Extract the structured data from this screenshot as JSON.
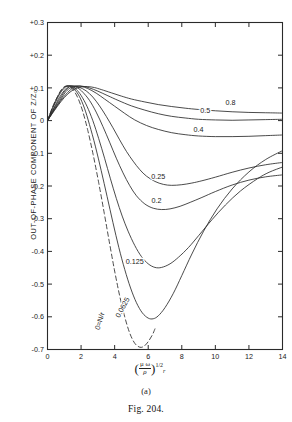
{
  "figure": {
    "caption": "Fig. 204.",
    "caption_prefix": "F",
    "caption_rest": "IG. 204.",
    "panel_label": "(a)"
  },
  "chart_data": {
    "type": "line",
    "title": "",
    "subtitle": "",
    "xlabel": "(μω/ρ)^1/2 r",
    "xlabel_parts": {
      "numerator": "μ ω",
      "denominator": "ρ",
      "exponent": "1/2",
      "trailing_var": "r"
    },
    "ylabel": "OUT-OF-PHASE COMPONENT OF Z/Z₀",
    "xlim": [
      0,
      14
    ],
    "ylim": [
      -0.7,
      0.3
    ],
    "grid": false,
    "legend_position": "inline-curve-labels",
    "xticks": [
      0,
      2,
      4,
      6,
      8,
      10,
      12,
      14
    ],
    "xticklabels": [
      "0",
      "2",
      "4",
      "6",
      "8",
      "10",
      "12",
      "14"
    ],
    "yticks": [
      0.3,
      0.2,
      0.1,
      0.0,
      -0.1,
      -0.2,
      -0.3,
      -0.4,
      -0.5,
      -0.6,
      -0.7
    ],
    "yticklabels": [
      "+0.3",
      "+0.2",
      "+0.1",
      "0",
      "-0.1",
      "-0.2",
      "-0.3",
      "-0.4",
      "-0.5",
      "-0.6",
      "-0.7"
    ],
    "annotations": [
      {
        "text": "0.8",
        "x": 10.9,
        "y": 0.047,
        "rotation": 0
      },
      {
        "text": "0.5",
        "x": 9.4,
        "y": 0.022,
        "rotation": 0
      },
      {
        "text": "0.4",
        "x": 9.0,
        "y": -0.034,
        "rotation": 0
      },
      {
        "text": "0.25",
        "x": 6.6,
        "y": -0.178,
        "rotation": 0
      },
      {
        "text": "0.2",
        "x": 6.5,
        "y": -0.252,
        "rotation": 0
      },
      {
        "text": "0.125",
        "x": 5.2,
        "y": -0.44,
        "rotation": 0
      },
      {
        "text": "0.0625",
        "x": 4.6,
        "y": -0.575,
        "rotation": -62
      },
      {
        "text": "0=N/r",
        "x": 3.25,
        "y": -0.615,
        "rotation": -73
      }
    ],
    "series": [
      {
        "name": "0.8",
        "label": "0.8",
        "style": "solid",
        "points": [
          [
            0,
            0
          ],
          [
            0.4,
            0.03
          ],
          [
            0.8,
            0.058
          ],
          [
            1.2,
            0.081
          ],
          [
            1.6,
            0.096
          ],
          [
            2.0,
            0.103
          ],
          [
            2.4,
            0.104
          ],
          [
            2.8,
            0.101
          ],
          [
            3.2,
            0.095
          ],
          [
            3.8,
            0.085
          ],
          [
            4.4,
            0.075
          ],
          [
            5.0,
            0.066
          ],
          [
            5.8,
            0.057
          ],
          [
            6.6,
            0.049
          ],
          [
            7.4,
            0.043
          ],
          [
            8.2,
            0.038
          ],
          [
            9.0,
            0.034
          ],
          [
            10.0,
            0.03
          ],
          [
            11.0,
            0.027
          ],
          [
            12.0,
            0.025
          ],
          [
            13.0,
            0.024
          ],
          [
            14.0,
            0.023
          ]
        ]
      },
      {
        "name": "0.5",
        "label": "0.5",
        "style": "solid",
        "points": [
          [
            0,
            0
          ],
          [
            0.4,
            0.032
          ],
          [
            0.8,
            0.062
          ],
          [
            1.2,
            0.086
          ],
          [
            1.5,
            0.099
          ],
          [
            1.8,
            0.105
          ],
          [
            2.1,
            0.105
          ],
          [
            2.5,
            0.1
          ],
          [
            3.0,
            0.09
          ],
          [
            3.6,
            0.076
          ],
          [
            4.2,
            0.062
          ],
          [
            5.0,
            0.045
          ],
          [
            5.8,
            0.032
          ],
          [
            6.6,
            0.021
          ],
          [
            7.4,
            0.013
          ],
          [
            8.2,
            0.008
          ],
          [
            9.0,
            0.004
          ],
          [
            10.0,
            0.002
          ],
          [
            11.0,
            0.001
          ],
          [
            12.0,
            0.002
          ],
          [
            13.0,
            0.003
          ],
          [
            14.0,
            0.004
          ]
        ]
      },
      {
        "name": "0.4",
        "label": "0.4",
        "style": "solid",
        "points": [
          [
            0,
            0
          ],
          [
            0.4,
            0.034
          ],
          [
            0.8,
            0.066
          ],
          [
            1.1,
            0.089
          ],
          [
            1.4,
            0.101
          ],
          [
            1.7,
            0.106
          ],
          [
            2.0,
            0.105
          ],
          [
            2.4,
            0.098
          ],
          [
            2.9,
            0.084
          ],
          [
            3.4,
            0.066
          ],
          [
            4.0,
            0.044
          ],
          [
            4.6,
            0.022
          ],
          [
            5.2,
            0.002
          ],
          [
            5.9,
            -0.015
          ],
          [
            6.6,
            -0.027
          ],
          [
            7.4,
            -0.037
          ],
          [
            8.2,
            -0.043
          ],
          [
            9.0,
            -0.047
          ],
          [
            10.0,
            -0.049
          ],
          [
            11.0,
            -0.049
          ],
          [
            12.0,
            -0.048
          ],
          [
            13.0,
            -0.046
          ],
          [
            14.0,
            -0.044
          ]
        ]
      },
      {
        "name": "0.25",
        "label": "0.25",
        "style": "solid",
        "points": [
          [
            0,
            0
          ],
          [
            0.4,
            0.038
          ],
          [
            0.8,
            0.072
          ],
          [
            1.0,
            0.088
          ],
          [
            1.3,
            0.103
          ],
          [
            1.6,
            0.106
          ],
          [
            1.9,
            0.102
          ],
          [
            2.3,
            0.091
          ],
          [
            2.7,
            0.072
          ],
          [
            3.1,
            0.045
          ],
          [
            3.5,
            0.013
          ],
          [
            3.9,
            -0.022
          ],
          [
            4.3,
            -0.059
          ],
          [
            4.7,
            -0.094
          ],
          [
            5.1,
            -0.124
          ],
          [
            5.5,
            -0.15
          ],
          [
            5.9,
            -0.17
          ],
          [
            6.4,
            -0.186
          ],
          [
            6.9,
            -0.195
          ],
          [
            7.4,
            -0.198
          ],
          [
            8.0,
            -0.196
          ],
          [
            8.6,
            -0.191
          ],
          [
            9.2,
            -0.184
          ],
          [
            10.0,
            -0.173
          ],
          [
            11.0,
            -0.158
          ],
          [
            12.0,
            -0.145
          ],
          [
            13.0,
            -0.135
          ],
          [
            14.0,
            -0.128
          ]
        ]
      },
      {
        "name": "0.2",
        "label": "0.2",
        "style": "solid",
        "points": [
          [
            0,
            0
          ],
          [
            0.4,
            0.04
          ],
          [
            0.7,
            0.07
          ],
          [
            1.0,
            0.092
          ],
          [
            1.25,
            0.104
          ],
          [
            1.5,
            0.106
          ],
          [
            1.8,
            0.1
          ],
          [
            2.1,
            0.087
          ],
          [
            2.5,
            0.062
          ],
          [
            2.9,
            0.026
          ],
          [
            3.3,
            -0.018
          ],
          [
            3.7,
            -0.066
          ],
          [
            4.1,
            -0.115
          ],
          [
            4.5,
            -0.16
          ],
          [
            4.9,
            -0.199
          ],
          [
            5.3,
            -0.23
          ],
          [
            5.8,
            -0.255
          ],
          [
            6.3,
            -0.268
          ],
          [
            6.8,
            -0.272
          ],
          [
            7.3,
            -0.27
          ],
          [
            7.9,
            -0.262
          ],
          [
            8.5,
            -0.25
          ],
          [
            9.2,
            -0.235
          ],
          [
            10.0,
            -0.217
          ],
          [
            11.0,
            -0.197
          ],
          [
            12.0,
            -0.182
          ],
          [
            13.0,
            -0.172
          ],
          [
            14.0,
            -0.166
          ]
        ]
      },
      {
        "name": "0.125",
        "label": "0.125",
        "style": "solid",
        "points": [
          [
            0,
            0
          ],
          [
            0.35,
            0.042
          ],
          [
            0.65,
            0.074
          ],
          [
            0.9,
            0.094
          ],
          [
            1.15,
            0.105
          ],
          [
            1.4,
            0.106
          ],
          [
            1.7,
            0.096
          ],
          [
            2.0,
            0.077
          ],
          [
            2.35,
            0.044
          ],
          [
            2.7,
            0.0
          ],
          [
            3.05,
            -0.055
          ],
          [
            3.4,
            -0.115
          ],
          [
            3.75,
            -0.178
          ],
          [
            4.1,
            -0.238
          ],
          [
            4.45,
            -0.292
          ],
          [
            4.8,
            -0.338
          ],
          [
            5.2,
            -0.382
          ],
          [
            5.6,
            -0.416
          ],
          [
            6.0,
            -0.438
          ],
          [
            6.4,
            -0.449
          ],
          [
            6.8,
            -0.449
          ],
          [
            7.3,
            -0.438
          ],
          [
            7.8,
            -0.418
          ],
          [
            8.4,
            -0.388
          ],
          [
            9.0,
            -0.352
          ],
          [
            9.8,
            -0.303
          ],
          [
            10.6,
            -0.258
          ],
          [
            11.5,
            -0.215
          ],
          [
            12.5,
            -0.178
          ],
          [
            13.2,
            -0.158
          ],
          [
            14.0,
            -0.142
          ]
        ]
      },
      {
        "name": "0.0625",
        "label": "0.0625",
        "style": "solid",
        "points": [
          [
            0,
            0
          ],
          [
            0.3,
            0.04
          ],
          [
            0.6,
            0.073
          ],
          [
            0.85,
            0.094
          ],
          [
            1.1,
            0.105
          ],
          [
            1.35,
            0.105
          ],
          [
            1.6,
            0.096
          ],
          [
            1.9,
            0.074
          ],
          [
            2.2,
            0.038
          ],
          [
            2.5,
            -0.012
          ],
          [
            2.85,
            -0.078
          ],
          [
            3.2,
            -0.153
          ],
          [
            3.55,
            -0.232
          ],
          [
            3.9,
            -0.312
          ],
          [
            4.25,
            -0.388
          ],
          [
            4.6,
            -0.455
          ],
          [
            4.95,
            -0.512
          ],
          [
            5.3,
            -0.557
          ],
          [
            5.65,
            -0.588
          ],
          [
            6.0,
            -0.604
          ],
          [
            6.3,
            -0.606
          ],
          [
            6.6,
            -0.597
          ],
          [
            7.0,
            -0.572
          ],
          [
            7.5,
            -0.528
          ],
          [
            8.0,
            -0.474
          ],
          [
            8.6,
            -0.408
          ],
          [
            9.3,
            -0.338
          ],
          [
            10.1,
            -0.27
          ],
          [
            11.0,
            -0.209
          ],
          [
            12.0,
            -0.157
          ],
          [
            13.0,
            -0.119
          ],
          [
            14.0,
            -0.092
          ]
        ]
      },
      {
        "name": "0=N/r",
        "label": "0=N/r",
        "style": "dashed",
        "points": [
          [
            0,
            0
          ],
          [
            0.3,
            0.041
          ],
          [
            0.6,
            0.074
          ],
          [
            0.82,
            0.094
          ],
          [
            1.05,
            0.105
          ],
          [
            1.3,
            0.104
          ],
          [
            1.55,
            0.093
          ],
          [
            1.82,
            0.068
          ],
          [
            2.1,
            0.028
          ],
          [
            2.4,
            -0.03
          ],
          [
            2.72,
            -0.104
          ],
          [
            3.05,
            -0.19
          ],
          [
            3.38,
            -0.283
          ],
          [
            3.7,
            -0.376
          ],
          [
            4.0,
            -0.46
          ],
          [
            4.3,
            -0.536
          ],
          [
            4.6,
            -0.6
          ],
          [
            4.9,
            -0.65
          ],
          [
            5.2,
            -0.681
          ],
          [
            5.5,
            -0.693
          ],
          [
            5.75,
            -0.69
          ],
          [
            6.0,
            -0.676
          ],
          [
            6.25,
            -0.655
          ],
          [
            6.4,
            -0.637
          ]
        ]
      }
    ]
  }
}
